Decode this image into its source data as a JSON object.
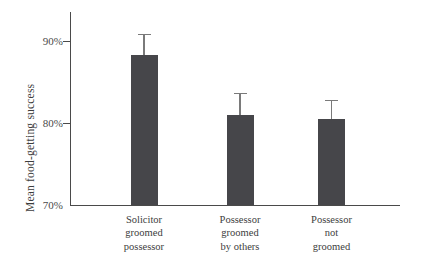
{
  "chart_data": {
    "type": "bar",
    "title": "",
    "xlabel": "",
    "ylabel": "Mean food-getting success",
    "categories": [
      "Solicitor\ngroomed\npossessor",
      "Possessor\ngroomed\nby others",
      "Possessor\nnot\ngroomed"
    ],
    "values": [
      88.3,
      80.9,
      80.5
    ],
    "errors": [
      2.6,
      2.8,
      2.3
    ],
    "error_upper": [
      90.9,
      83.7,
      82.8
    ],
    "ylim": [
      70,
      92.5
    ],
    "ytick_values": [
      70,
      80,
      90
    ],
    "ytick_labels": [
      "70%",
      "80%",
      "90%"
    ],
    "grid": false,
    "legend": false,
    "bar_color": "#46464a",
    "axis_color": "#4a4a4a",
    "error_bar_color": "#7a7a7a",
    "background_color": "#ffffff"
  },
  "axes": {
    "y_title": "Mean food-getting success",
    "y_ticks": [
      {
        "label": "90%",
        "value": 90
      },
      {
        "label": "80%",
        "value": 80
      },
      {
        "label": "70%",
        "value": 70
      }
    ]
  },
  "bars": [
    {
      "label": "Solicitor\ngroomed\npossessor",
      "value": 88.3,
      "error": 2.6
    },
    {
      "label": "Possessor\ngroomed\nby others",
      "value": 80.9,
      "error": 2.8
    },
    {
      "label": "Possessor\nnot\ngroomed",
      "value": 80.5,
      "error": 2.3
    }
  ]
}
